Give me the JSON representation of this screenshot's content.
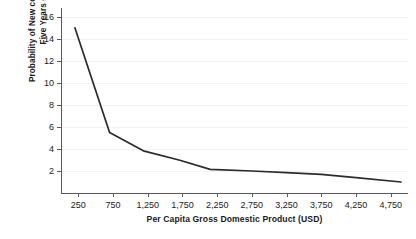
{
  "chart_data": {
    "type": "line",
    "title": "",
    "xlabel": "Per Capita Gross Domestic Product (USD)",
    "ylabel_line1": "Probability of New conflict within",
    "ylabel_line2": "Five Years (%)",
    "ylabel": "Probability of New conflict within Five Years (%)",
    "xlim": [
      0,
      5000
    ],
    "ylim": [
      0,
      16.8
    ],
    "grid": true,
    "legend": "none",
    "xticks": [
      250,
      750,
      1250,
      1750,
      2250,
      2750,
      3250,
      3750,
      4250,
      4750
    ],
    "xtick_labels": [
      "250",
      "750",
      "1,250",
      "1,750",
      "2,250",
      "2,750",
      "3,250",
      "3,750",
      "4,250",
      "4,750"
    ],
    "yticks": [
      2,
      4,
      6,
      8,
      10,
      12,
      14,
      16
    ],
    "ytick_labels": [
      "2",
      "4",
      "6",
      "8",
      "10",
      "12",
      "14",
      "16"
    ],
    "series": [
      {
        "name": "Probability of new conflict",
        "color": "#2b2b2b",
        "x": [
          200,
          700,
          1200,
          1700,
          2150,
          2750,
          3250,
          3750,
          4250,
          4900
        ],
        "y": [
          15.0,
          5.5,
          3.8,
          3.0,
          2.15,
          2.0,
          1.85,
          1.7,
          1.4,
          1.0
        ]
      }
    ]
  }
}
